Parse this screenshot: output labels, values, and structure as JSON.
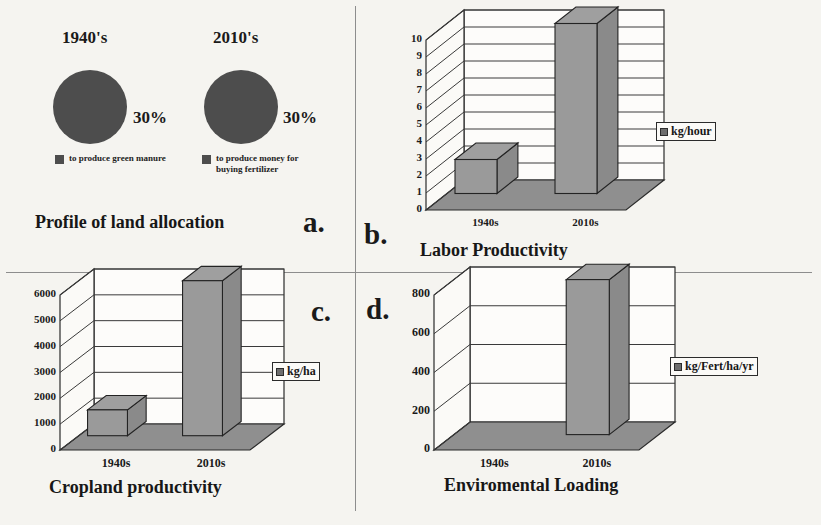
{
  "figure": {
    "background_color": "#f5f4f0",
    "bar_fill_color": "#9a9a9a",
    "pie_fill_color": "#4d4d4d"
  },
  "panels": {
    "a": {
      "letter": "a.",
      "title": "Profile of land allocation",
      "pies": [
        {
          "header": "1940's",
          "percent_label": "30%",
          "legend_label": "to produce green manure"
        },
        {
          "header": "2010's",
          "percent_label": "30%",
          "legend_label": "to produce money for buying fertilizer"
        }
      ]
    },
    "b": {
      "letter": "b.",
      "title": "Labor Productivity",
      "legend_label": "kg/hour"
    },
    "c": {
      "letter": "c.",
      "title": "Cropland productivity",
      "legend_label": "kg/ha"
    },
    "d": {
      "letter": "d.",
      "title": "Enviromental Loading",
      "legend_label": "kg/Fert/ha/yr"
    }
  },
  "chart_data": [
    {
      "type": "pie",
      "panel": "a",
      "title": "Profile of land allocation",
      "subtitle": "1940's",
      "labels": [
        "to produce green manure"
      ],
      "values": [
        30
      ],
      "value_labels": [
        "30%"
      ],
      "legend_position": "below"
    },
    {
      "type": "pie",
      "panel": "a",
      "title": "Profile of land allocation",
      "subtitle": "2010's",
      "labels": [
        "to produce money for buying fertilizer"
      ],
      "values": [
        30
      ],
      "value_labels": [
        "30%"
      ],
      "legend_position": "below"
    },
    {
      "type": "bar",
      "panel": "b",
      "title": "Labor Productivity",
      "categories": [
        "1940s",
        "2010s"
      ],
      "values": [
        2,
        10
      ],
      "series": [
        {
          "name": "kg/hour",
          "values": [
            2,
            10
          ]
        }
      ],
      "xlabel": "",
      "ylabel": "kg/hour",
      "ylim": [
        0,
        10
      ],
      "yticks": [
        0,
        1,
        2,
        3,
        4,
        5,
        6,
        7,
        8,
        9,
        10
      ],
      "ytick_labels": [
        "0",
        "1",
        "2",
        "3",
        "4",
        "5",
        "6",
        "7",
        "8",
        "9",
        "10"
      ],
      "grid": true,
      "legend_position": "right",
      "style": "3d"
    },
    {
      "type": "bar",
      "panel": "c",
      "title": "Cropland productivity",
      "categories": [
        "1940s",
        "2010s"
      ],
      "values": [
        1000,
        6000
      ],
      "series": [
        {
          "name": "kg/ha",
          "values": [
            1000,
            6000
          ]
        }
      ],
      "xlabel": "",
      "ylabel": "kg/ha",
      "ylim": [
        0,
        6000
      ],
      "yticks": [
        0,
        1000,
        2000,
        3000,
        4000,
        5000,
        6000
      ],
      "ytick_labels": [
        "0",
        "1000",
        "2000",
        "3000",
        "4000",
        "5000",
        "6000"
      ],
      "grid": true,
      "legend_position": "right",
      "style": "3d"
    },
    {
      "type": "bar",
      "panel": "d",
      "title": "Enviromental Loading",
      "categories": [
        "1940s",
        "2010s"
      ],
      "values": [
        0,
        800
      ],
      "series": [
        {
          "name": "kg/Fert/ha/yr",
          "values": [
            0,
            800
          ]
        }
      ],
      "xlabel": "",
      "ylabel": "kg/Fert/ha/yr",
      "ylim": [
        0,
        800
      ],
      "yticks": [
        0,
        200,
        400,
        600,
        800
      ],
      "ytick_labels": [
        "0",
        "200",
        "400",
        "600",
        "800"
      ],
      "grid": true,
      "legend_position": "right",
      "style": "3d"
    }
  ]
}
